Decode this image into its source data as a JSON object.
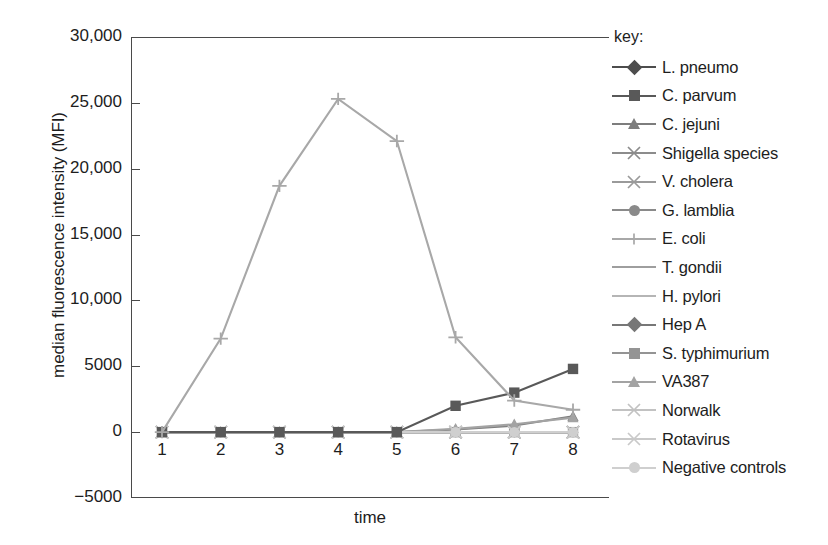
{
  "chart_data": {
    "type": "line",
    "title": "",
    "xlabel": "time",
    "ylabel": "median fluorescence intensity (MFI)",
    "x": [
      1,
      2,
      3,
      4,
      5,
      6,
      7,
      8
    ],
    "xtick_labels": [
      "1",
      "2",
      "3",
      "4",
      "5",
      "6",
      "7",
      "8"
    ],
    "ytick_labels": [
      "30,000",
      "25,000",
      "20,000",
      "15,000",
      "10,000",
      "5000",
      "0",
      "-5000"
    ],
    "ytick_values": [
      30000,
      25000,
      20000,
      15000,
      10000,
      5000,
      0,
      -5000
    ],
    "ylim": [
      -5000,
      30000
    ],
    "xlim": [
      1,
      8
    ],
    "grid": false,
    "legend_position": "right",
    "legend_title": "key:",
    "series": [
      {
        "name": "L. pneumo",
        "marker": "diamond",
        "color": "#4d4d4d",
        "values": [
          0,
          0,
          0,
          0,
          0,
          0,
          0,
          0
        ]
      },
      {
        "name": "C. parvum",
        "marker": "square",
        "color": "#595959",
        "values": [
          0,
          0,
          0,
          0,
          0,
          2000,
          3000,
          4800
        ]
      },
      {
        "name": "C. jejuni",
        "marker": "triangle",
        "color": "#7d7d7d",
        "values": [
          0,
          0,
          0,
          0,
          0,
          200,
          500,
          1200
        ]
      },
      {
        "name": "Shigella species",
        "marker": "x",
        "color": "#8c8c8c",
        "values": [
          0,
          0,
          0,
          0,
          0,
          0,
          0,
          0
        ]
      },
      {
        "name": "V. cholera",
        "marker": "x",
        "color": "#9a9a9a",
        "values": [
          0,
          0,
          0,
          0,
          0,
          0,
          0,
          0
        ]
      },
      {
        "name": "G. lamblia",
        "marker": "circle",
        "color": "#8a8a8a",
        "values": [
          0,
          0,
          0,
          0,
          0,
          0,
          0,
          0
        ]
      },
      {
        "name": "E. coli",
        "marker": "plus",
        "color": "#a8a8a8",
        "values": [
          0,
          7100,
          18700,
          25300,
          22100,
          7200,
          2400,
          1700
        ]
      },
      {
        "name": "T. gondii",
        "marker": "none",
        "color": "#9e9e9e",
        "values": [
          0,
          0,
          0,
          0,
          0,
          0,
          0,
          0
        ]
      },
      {
        "name": "H. pylori",
        "marker": "none",
        "color": "#b5b5b5",
        "values": [
          0,
          0,
          0,
          0,
          0,
          0,
          0,
          0
        ]
      },
      {
        "name": "Hep A",
        "marker": "diamond",
        "color": "#777777",
        "values": [
          0,
          0,
          0,
          0,
          0,
          0,
          0,
          0
        ]
      },
      {
        "name": "S. typhimurium",
        "marker": "square",
        "color": "#949494",
        "values": [
          0,
          0,
          0,
          0,
          0,
          0,
          0,
          0
        ]
      },
      {
        "name": "VA387",
        "marker": "triangle",
        "color": "#a3a3a3",
        "values": [
          0,
          0,
          0,
          0,
          0,
          250,
          600,
          1100
        ]
      },
      {
        "name": "Norwalk",
        "marker": "x",
        "color": "#c2c2c2",
        "values": [
          0,
          0,
          0,
          0,
          0,
          0,
          0,
          0
        ]
      },
      {
        "name": "Rotavirus",
        "marker": "x",
        "color": "#c9c9c9",
        "values": [
          0,
          0,
          0,
          0,
          0,
          0,
          0,
          0
        ]
      },
      {
        "name": "Negative controls",
        "marker": "circle",
        "color": "#cfcfcf",
        "values": [
          0,
          0,
          0,
          0,
          0,
          0,
          0,
          0
        ]
      }
    ]
  },
  "axes": {
    "ylabel": "median fluorescence intensity (MFI)",
    "xlabel": "time"
  },
  "legend": {
    "title": "key:"
  },
  "colors": {
    "axis": "#4a4a4a",
    "text": "#1d1d1d",
    "background": "#ffffff"
  }
}
